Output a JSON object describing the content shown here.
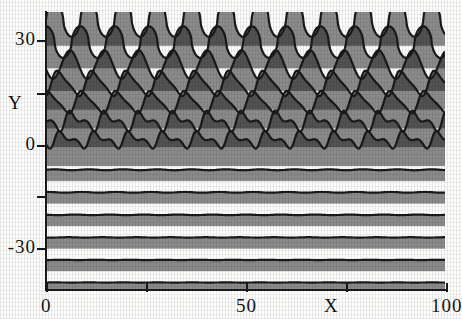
{
  "figure": {
    "background_color": "#fdfdfc",
    "ink_color": "#1a1a1a"
  },
  "axes": {
    "y_name": "Y",
    "x_name": "X",
    "y_labels": [
      {
        "text": "30",
        "value": 30,
        "px_y": 40
      },
      {
        "text": "",
        "value": 15,
        "px_y": 93
      },
      {
        "text": "0",
        "value": 0,
        "px_y": 145
      },
      {
        "text": "",
        "value": -15,
        "px_y": 196
      },
      {
        "text": "-30",
        "value": -30,
        "px_y": 248
      }
    ],
    "x_labels": [
      {
        "text": "0",
        "value": 0,
        "px_x": 46
      },
      {
        "text": "",
        "value": 25,
        "px_x": 146
      },
      {
        "text": "50",
        "value": 50,
        "px_x": 246
      },
      {
        "text": "",
        "value": 75,
        "px_x": 346
      },
      {
        "text": "100",
        "value": 100,
        "px_x": 446
      }
    ]
  },
  "chart_data": {
    "type": "line",
    "title": "",
    "subtitle": "",
    "xlabel": "X",
    "ylabel": "Y",
    "xlim": [
      0,
      128
    ],
    "ylim": [
      -38,
      36
    ],
    "grid": false,
    "legend": "none",
    "annotations": [],
    "style": {
      "render": "stacked waterfall of oscillating traces, each filled downward with dense vertical hatch lines",
      "hatch_spacing_px": 2,
      "trace_count": 13
    },
    "x_ticks": [
      0,
      25,
      50,
      75,
      100
    ],
    "y_ticks": [
      -30,
      -15,
      0,
      15,
      30
    ],
    "series": [
      {
        "name": "trace-1",
        "baseline": 34,
        "amplitude": 4.6,
        "wavelength": 11.0,
        "phase": 0.0,
        "shape": "cusped",
        "values": []
      },
      {
        "name": "trace-2",
        "baseline": 28,
        "amplitude": 4.2,
        "wavelength": 11.0,
        "phase": 0.25,
        "shape": "cusped",
        "values": []
      },
      {
        "name": "trace-3",
        "baseline": 22,
        "amplitude": 3.8,
        "wavelength": 11.0,
        "phase": 0.55,
        "shape": "rounded",
        "values": []
      },
      {
        "name": "trace-4",
        "baseline": 17,
        "amplitude": 3.4,
        "wavelength": 11.0,
        "phase": 0.85,
        "shape": "skewed",
        "values": []
      },
      {
        "name": "trace-5",
        "baseline": 12,
        "amplitude": 3.0,
        "wavelength": 11.0,
        "phase": 1.15,
        "shape": "skewed",
        "values": []
      },
      {
        "name": "trace-6",
        "baseline": 7,
        "amplitude": 2.6,
        "wavelength": 11.0,
        "phase": 1.45,
        "shape": "sawtooth",
        "values": []
      },
      {
        "name": "trace-7",
        "baseline": 2,
        "amplitude": 2.2,
        "wavelength": 11.0,
        "phase": 1.75,
        "shape": "sawtooth",
        "values": []
      },
      {
        "name": "trace-8",
        "baseline": -6,
        "amplitude": 0.5,
        "wavelength": 11.0,
        "phase": 2.0,
        "shape": "flat",
        "values": []
      },
      {
        "name": "trace-9",
        "baseline": -12,
        "amplitude": 0.4,
        "wavelength": 11.0,
        "phase": 2.2,
        "shape": "flat",
        "values": []
      },
      {
        "name": "trace-10",
        "baseline": -18,
        "amplitude": 0.3,
        "wavelength": 11.0,
        "phase": 2.4,
        "shape": "flat",
        "values": []
      },
      {
        "name": "trace-11",
        "baseline": -24,
        "amplitude": 0.2,
        "wavelength": 11.0,
        "phase": 2.6,
        "shape": "flat",
        "values": []
      },
      {
        "name": "trace-12",
        "baseline": -30,
        "amplitude": 0.2,
        "wavelength": 11.0,
        "phase": 2.8,
        "shape": "flat",
        "values": []
      },
      {
        "name": "trace-13",
        "baseline": -36,
        "amplitude": 0.1,
        "wavelength": 11.0,
        "phase": 3.0,
        "shape": "flat",
        "values": []
      }
    ]
  }
}
